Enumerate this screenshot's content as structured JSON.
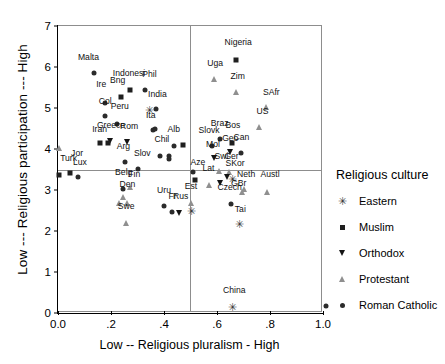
{
  "chart_data": {
    "type": "scatter",
    "title": "",
    "xlabel": "Low -- Religious pluralism - High",
    "ylabel": "Low --- Religious participation --- High",
    "xlim": [
      0.0,
      1.0
    ],
    "ylim": [
      0,
      7
    ],
    "xticks": [
      "0.0",
      ".2",
      ".4",
      ".6",
      ".8",
      "1.0"
    ],
    "xtickvals": [
      0.0,
      0.2,
      0.4,
      0.6,
      0.8,
      1.0
    ],
    "yticks": [
      "0",
      "1",
      "2",
      "3",
      "4",
      "5",
      "6",
      "7"
    ],
    "ytickvals": [
      0,
      1,
      2,
      3,
      4,
      5,
      6,
      7
    ],
    "grid": false,
    "reference_lines": {
      "vertical_x": 0.5,
      "horizontal_y": 3.5
    },
    "legend": {
      "title": "Religious culture",
      "position": "right",
      "entries": [
        {
          "label": "Eastern",
          "marker": "star"
        },
        {
          "label": "Muslim",
          "marker": "square"
        },
        {
          "label": "Orthodox",
          "marker": "triangle-down"
        },
        {
          "label": "Protestant",
          "marker": "triangle-up"
        },
        {
          "label": "Roman Catholic",
          "marker": "circle"
        }
      ]
    },
    "points": [
      {
        "label": "Malta",
        "x": 0.135,
        "y": 5.86,
        "marker": "circle",
        "lx": 0.115,
        "ly": 6.12
      },
      {
        "label": "Indonesi",
        "x": 0.273,
        "y": 5.44,
        "marker": "square",
        "lx": 0.268,
        "ly": 5.72
      },
      {
        "label": "Phil",
        "x": 0.33,
        "y": 5.45,
        "marker": "circle",
        "lx": 0.345,
        "ly": 5.71
      },
      {
        "label": "Bng",
        "x": 0.236,
        "y": 5.28,
        "marker": "square",
        "lx": 0.225,
        "ly": 5.56
      },
      {
        "label": "Ire",
        "x": 0.178,
        "y": 5.12,
        "marker": "circle",
        "lx": 0.163,
        "ly": 5.46
      },
      {
        "label": "India",
        "x": 0.37,
        "y": 4.97,
        "marker": "circle",
        "lx": 0.375,
        "ly": 5.22
      },
      {
        "label": "India-e",
        "x": 0.345,
        "y": 4.94,
        "marker": "star",
        "lx": null,
        "ly": null
      },
      {
        "label": "Col",
        "x": 0.178,
        "y": 4.8,
        "marker": "circle",
        "lx": 0.178,
        "ly": 5.05
      },
      {
        "label": "Peru",
        "x": 0.222,
        "y": 4.62,
        "marker": "circle",
        "lx": 0.233,
        "ly": 4.92
      },
      {
        "label": "Ita",
        "x": 0.358,
        "y": 4.46,
        "marker": "circle",
        "lx": 0.35,
        "ly": 4.7
      },
      {
        "label": "Ita2",
        "x": 0.366,
        "y": 4.5,
        "marker": "circle",
        "lx": null,
        "ly": null
      },
      {
        "label": "Greece",
        "x": 0.196,
        "y": 4.19,
        "marker": "triangle-down",
        "lx": 0.2,
        "ly": 4.47
      },
      {
        "label": "Rom",
        "x": 0.262,
        "y": 4.17,
        "marker": "triangle-down",
        "lx": 0.268,
        "ly": 4.45
      },
      {
        "label": "Iran",
        "x": 0.16,
        "y": 4.14,
        "marker": "square",
        "lx": 0.157,
        "ly": 4.37
      },
      {
        "label": "Iran2",
        "x": 0.188,
        "y": 4.14,
        "marker": "square",
        "lx": null,
        "ly": null
      },
      {
        "label": "Turk",
        "x": 0.005,
        "y": 4.02,
        "marker": "triangle-up",
        "lx": 0.04,
        "ly": 3.66
      },
      {
        "label": "Turk2",
        "x": 0.005,
        "y": 3.37,
        "marker": "square",
        "lx": null,
        "ly": null
      },
      {
        "label": "Alb",
        "x": 0.438,
        "y": 4.08,
        "marker": "circle",
        "lx": 0.437,
        "ly": 4.36
      },
      {
        "label": "Alb2",
        "x": 0.472,
        "y": 4.09,
        "marker": "square",
        "lx": null,
        "ly": null
      },
      {
        "label": "Chil",
        "x": 0.385,
        "y": 3.83,
        "marker": "circle",
        "lx": 0.392,
        "ly": 4.11
      },
      {
        "label": "Chil2",
        "x": 0.417,
        "y": 3.84,
        "marker": "circle",
        "lx": null,
        "ly": null
      },
      {
        "label": "Chil3",
        "x": 0.417,
        "y": 3.76,
        "marker": "circle",
        "lx": null,
        "ly": null
      },
      {
        "label": "Arg",
        "x": 0.253,
        "y": 3.68,
        "marker": "circle",
        "lx": 0.247,
        "ly": 3.94
      },
      {
        "label": "Slov",
        "x": 0.302,
        "y": 3.52,
        "marker": "circle",
        "lx": 0.318,
        "ly": 3.79
      },
      {
        "label": "Jor",
        "x": 0.046,
        "y": 3.42,
        "marker": "square",
        "lx": 0.072,
        "ly": 3.77
      },
      {
        "label": "Lux",
        "x": 0.076,
        "y": 3.31,
        "marker": "circle",
        "lx": 0.083,
        "ly": 3.55
      },
      {
        "label": "Belg",
        "x": 0.246,
        "y": 3.03,
        "marker": "circle",
        "lx": 0.248,
        "ly": 3.31
      },
      {
        "label": "Fin",
        "x": 0.272,
        "y": 3.08,
        "marker": "triangle-up",
        "lx": 0.288,
        "ly": 3.26
      },
      {
        "label": "Den",
        "x": 0.246,
        "y": 2.83,
        "marker": "triangle-up",
        "lx": 0.262,
        "ly": 3.02
      },
      {
        "label": "Den2",
        "x": 0.232,
        "y": 2.68,
        "marker": "triangle-up",
        "lx": null,
        "ly": null
      },
      {
        "label": "Den3",
        "x": 0.262,
        "y": 2.68,
        "marker": "triangle-up",
        "lx": null,
        "ly": null
      },
      {
        "label": "Swe",
        "x": 0.256,
        "y": 2.2,
        "marker": "triangle-up",
        "lx": 0.257,
        "ly": 2.48
      },
      {
        "label": "Uru",
        "x": 0.4,
        "y": 2.6,
        "marker": "circle",
        "lx": 0.4,
        "ly": 2.87
      },
      {
        "label": "Fr",
        "x": 0.43,
        "y": 2.47,
        "marker": "circle",
        "lx": 0.432,
        "ly": 2.72
      },
      {
        "label": "Rus",
        "x": 0.458,
        "y": 2.44,
        "marker": "triangle-down",
        "lx": 0.463,
        "ly": 2.72
      },
      {
        "label": "Est",
        "x": 0.5,
        "y": 2.68,
        "marker": "triangle-up",
        "lx": 0.502,
        "ly": 2.98
      },
      {
        "label": "Est2",
        "x": 0.502,
        "y": 2.48,
        "marker": "star",
        "lx": null,
        "ly": null
      },
      {
        "label": "Aze",
        "x": 0.51,
        "y": 3.43,
        "marker": "circle",
        "lx": 0.528,
        "ly": 3.56
      },
      {
        "label": "Aze2",
        "x": 0.516,
        "y": 3.24,
        "marker": "square",
        "lx": null,
        "ly": null
      },
      {
        "label": "Nigeria",
        "x": 0.672,
        "y": 6.18,
        "marker": "square",
        "lx": 0.68,
        "ly": 6.5
      },
      {
        "label": "Uga",
        "x": 0.59,
        "y": 5.7,
        "marker": "triangle-up",
        "lx": 0.593,
        "ly": 5.98
      },
      {
        "label": "Zim",
        "x": 0.672,
        "y": 5.4,
        "marker": "triangle-up",
        "lx": 0.678,
        "ly": 5.66
      },
      {
        "label": "SAfr",
        "x": 0.785,
        "y": 5.02,
        "marker": "triangle-up",
        "lx": 0.805,
        "ly": 5.26
      },
      {
        "label": "US",
        "x": 0.76,
        "y": 4.53,
        "marker": "triangle-up",
        "lx": 0.772,
        "ly": 4.8
      },
      {
        "label": "Braz",
        "x": 0.612,
        "y": 4.25,
        "marker": "circle",
        "lx": 0.61,
        "ly": 4.52
      },
      {
        "label": "Slovk",
        "x": 0.58,
        "y": 4.08,
        "marker": "circle",
        "lx": 0.57,
        "ly": 4.33
      },
      {
        "label": "Bos",
        "x": 0.658,
        "y": 4.15,
        "marker": "square",
        "lx": 0.66,
        "ly": 4.46
      },
      {
        "label": "Can",
        "x": 0.69,
        "y": 3.9,
        "marker": "circle",
        "lx": 0.692,
        "ly": 4.16
      },
      {
        "label": "Geo",
        "x": 0.648,
        "y": 3.92,
        "marker": "triangle-down",
        "lx": 0.65,
        "ly": 4.15
      },
      {
        "label": "Mol",
        "x": 0.588,
        "y": 3.78,
        "marker": "triangle-down",
        "lx": 0.585,
        "ly": 4.0
      },
      {
        "label": "Swi",
        "x": 0.607,
        "y": 3.47,
        "marker": "triangle-up",
        "lx": 0.617,
        "ly": 3.7
      },
      {
        "label": "Ger",
        "x": 0.645,
        "y": 3.43,
        "marker": "triangle-up",
        "lx": 0.655,
        "ly": 3.7
      },
      {
        "label": "SKor",
        "x": 0.66,
        "y": 3.27,
        "marker": "star",
        "lx": 0.668,
        "ly": 3.53
      },
      {
        "label": "SKor2",
        "x": 0.638,
        "y": 3.32,
        "marker": "triangle-down",
        "lx": null,
        "ly": null
      },
      {
        "label": "Lat",
        "x": 0.57,
        "y": 3.12,
        "marker": "triangle-up",
        "lx": 0.568,
        "ly": 3.42
      },
      {
        "label": "Lat2",
        "x": 0.61,
        "y": 3.16,
        "marker": "triangle-down",
        "lx": null,
        "ly": null
      },
      {
        "label": "Neth",
        "x": 0.7,
        "y": 3.03,
        "marker": "triangle-up",
        "lx": 0.71,
        "ly": 3.26
      },
      {
        "label": "GBr",
        "x": 0.695,
        "y": 2.95,
        "marker": "triangle-up",
        "lx": 0.682,
        "ly": 3.05
      },
      {
        "label": "Austl",
        "x": 0.79,
        "y": 2.96,
        "marker": "triangle-up",
        "lx": 0.8,
        "ly": 3.27
      },
      {
        "label": "Czech",
        "x": 0.652,
        "y": 2.65,
        "marker": "circle",
        "lx": 0.648,
        "ly": 2.95
      },
      {
        "label": "Tai",
        "x": 0.685,
        "y": 2.16,
        "marker": "star",
        "lx": 0.688,
        "ly": 2.42
      },
      {
        "label": "China",
        "x": 0.66,
        "y": 0.14,
        "marker": "star",
        "lx": 0.665,
        "ly": 0.45
      },
      {
        "label": "edge",
        "x": 1.01,
        "y": 0.18,
        "marker": "circle",
        "lx": null,
        "ly": null
      }
    ]
  },
  "legend": {
    "title": "Religious culture",
    "entries": [
      {
        "label": "Eastern"
      },
      {
        "label": "Muslim"
      },
      {
        "label": "Orthodox"
      },
      {
        "label": "Protestant"
      },
      {
        "label": "Roman Catholic"
      }
    ]
  },
  "axes": {
    "x_title": "Low -- Religious pluralism - High",
    "y_title": "Low --- Religious participation --- High"
  }
}
